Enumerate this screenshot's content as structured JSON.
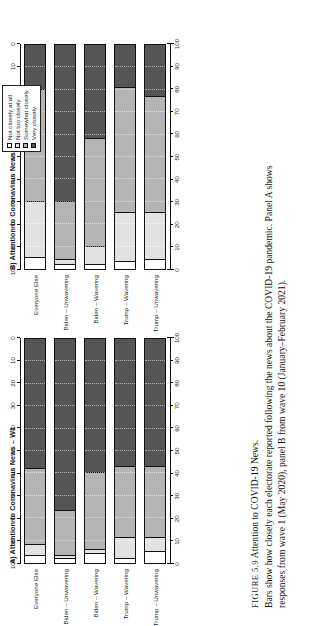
{
  "figure": {
    "number_label": "FIGURE 5.9",
    "title": "Attention to COVID-19 News.",
    "caption_line_1": "Bars show how closely each electorate reported following the news about the COVID-19 pandemic. Panel A shows",
    "caption_line_2": "responses from wave 1 (May 2020), panel B from wave 10 (January–February 2021)."
  },
  "legend": {
    "items": [
      {
        "label": "Not closely at all",
        "color": "#ffffff"
      },
      {
        "label": "Not too closely",
        "color": "#e2e2e2"
      },
      {
        "label": "Somewhat closely",
        "color": "#b4b4b4"
      },
      {
        "label": "Very closely",
        "color": "#555555"
      }
    ]
  },
  "axis": {
    "ticks": [
      0,
      10,
      20,
      30,
      40,
      50,
      60,
      70,
      80,
      90,
      100
    ],
    "top_tick_labels": [
      "0",
      "10",
      "20",
      "30",
      "40",
      "50",
      "60",
      "70",
      "80",
      "90",
      "100"
    ],
    "bottom_tick_labels": [
      "0",
      "10",
      "20",
      "30",
      "40",
      "50",
      "60",
      "70",
      "80",
      "90",
      "100"
    ],
    "range": [
      0,
      100
    ]
  },
  "chart_data": [
    {
      "id": "panelA",
      "type": "bar",
      "orientation": "horizontal-stacked",
      "title": "A) Attention to Coronavirus News – W1",
      "xlabel": "",
      "ylabel": "",
      "xlim": [
        0,
        100
      ],
      "grid": true,
      "legend_position": "right-outside",
      "categories": [
        "Everyone Else",
        "Biden – Unwavering",
        "Biden – Wavering",
        "Trump – Wavering",
        "Trump – Unwavering"
      ],
      "series": [
        {
          "name": "Not closely at all",
          "values": [
            3,
            2,
            4,
            2,
            5
          ]
        },
        {
          "name": "Not too closely",
          "values": [
            5,
            1,
            2,
            9,
            6
          ]
        },
        {
          "name": "Somewhat closely",
          "values": [
            34,
            20,
            34,
            32,
            32
          ]
        },
        {
          "name": "Very closely",
          "values": [
            58,
            77,
            60,
            57,
            57
          ]
        }
      ]
    },
    {
      "id": "panelB",
      "type": "bar",
      "orientation": "horizontal-stacked",
      "title": "B) Attention to Coronavirus News – W10",
      "xlabel": "",
      "ylabel": "",
      "xlim": [
        0,
        100
      ],
      "grid": true,
      "legend_position": "right-outside",
      "categories": [
        "Everyone Else",
        "Biden – Unwavering",
        "Biden – Wavering",
        "Trump – Wavering",
        "Trump – Unwavering"
      ],
      "series": [
        {
          "name": "Not closely at all",
          "values": [
            5,
            2,
            2,
            3,
            4
          ]
        },
        {
          "name": "Not too closely",
          "values": [
            25,
            2,
            8,
            22,
            21
          ]
        },
        {
          "name": "Somewhat closely",
          "values": [
            50,
            26,
            48,
            56,
            52
          ]
        },
        {
          "name": "Very closely",
          "values": [
            20,
            70,
            42,
            19,
            23
          ]
        }
      ]
    }
  ]
}
